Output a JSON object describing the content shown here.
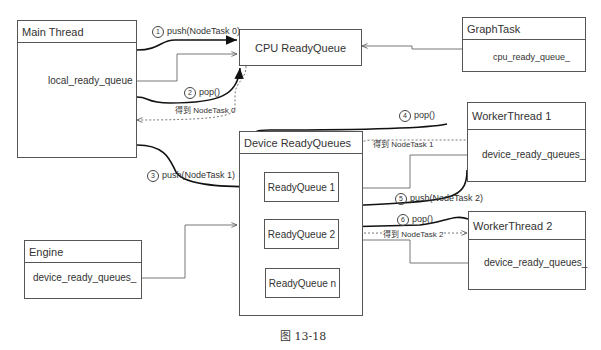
{
  "boxes": {
    "main_thread": {
      "title": "Main Thread",
      "field": "local_ready_queue"
    },
    "cpu_ready_queue": {
      "title": "CPU ReadyQueue"
    },
    "graph_task": {
      "title": "GraphTask",
      "field": "cpu_ready_queue_"
    },
    "device_ready_queues": {
      "title": "Device ReadyQueues",
      "queues": [
        "ReadyQueue 1",
        "ReadyQueue 2",
        "ReadyQueue n"
      ]
    },
    "worker_thread_1": {
      "title": "WorkerThread 1",
      "field": "device_ready_queues_"
    },
    "worker_thread_2": {
      "title": "WorkerThread 2",
      "field": "device_ready_queues_"
    },
    "engine": {
      "title": "Engine",
      "field": "device_ready_queues_"
    }
  },
  "steps": [
    {
      "num": "1",
      "text": "push(NodeTask 0)"
    },
    {
      "num": "2",
      "text": "pop()"
    },
    {
      "num": "3",
      "text": "push(NodeTask 1)"
    },
    {
      "num": "4",
      "text": "pop()"
    },
    {
      "num": "5",
      "text": "push(NodeTask 2)"
    },
    {
      "num": "6",
      "text": "pop()"
    }
  ],
  "results": [
    "得到 NodeTask 0",
    "得到 NodeTask 1",
    "得到 NodeTask 2"
  ],
  "caption": "图 13-18"
}
